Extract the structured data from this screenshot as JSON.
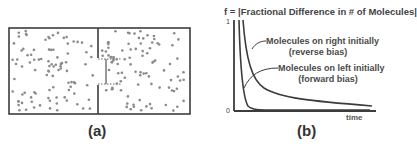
{
  "panel_a": {
    "caption": "(a)",
    "description": "Box divided into two chambers by a wall with a gate; molecules (dots) distributed on both sides",
    "colors": {
      "border": "#3c3c3c",
      "molecule": "#8a8a8a",
      "gate_dotted": "#555555"
    }
  },
  "panel_b": {
    "caption": "(b)",
    "title": "f = |Fractional Difference in # of Molecules|",
    "y_tick_top": "1",
    "y_tick_bottom": "0",
    "x_axis_label": "time",
    "curve_labels": {
      "right": {
        "line1": "Molecules on right initially",
        "line2": "(reverse bias)"
      },
      "left": {
        "line1": "Molecules on left initially",
        "line2": "(forward bias)"
      }
    }
  },
  "chart_data": {
    "type": "line",
    "title": "f = |Fractional Difference in # of Molecules|",
    "xlabel": "time",
    "ylabel": "f",
    "ylim": [
      0,
      1
    ],
    "grid": false,
    "legend_position": "inline annotations",
    "series": [
      {
        "name": "Molecules on right initially (reverse bias)",
        "shape": "slow decay from 1 toward ~0.05",
        "x": [
          0.04,
          0.06,
          0.08,
          0.1,
          0.15,
          0.2,
          0.3,
          0.4,
          0.6,
          0.8,
          1.0
        ],
        "values": [
          1.0,
          0.78,
          0.6,
          0.47,
          0.33,
          0.26,
          0.19,
          0.15,
          0.1,
          0.07,
          0.05
        ]
      },
      {
        "name": "Molecules on left initially (forward bias)",
        "shape": "fast decay from 1 to ~0",
        "x": [
          0.02,
          0.03,
          0.04,
          0.06,
          0.08,
          0.1,
          0.15,
          0.2,
          1.0
        ],
        "values": [
          1.0,
          0.55,
          0.3,
          0.12,
          0.05,
          0.02,
          0.005,
          0.0,
          0.0
        ]
      }
    ]
  }
}
